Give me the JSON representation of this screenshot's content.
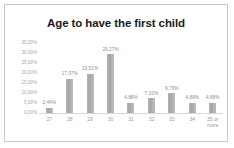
{
  "chart_data": {
    "type": "bar",
    "title": "Age to have the first child",
    "xlabel": "",
    "ylabel": "",
    "categories": [
      "27",
      "28",
      "29",
      "30",
      "31",
      "32",
      "33",
      "34",
      "35 or more"
    ],
    "values": [
      2.44,
      17.07,
      19.51,
      29.27,
      4.88,
      7.32,
      9.76,
      4.88,
      4.88
    ],
    "data_labels": [
      "2,44%",
      "17,07%",
      "19,51%",
      "29,27%",
      "4,88%",
      "7,32%",
      "9,76%",
      "4,88%",
      "4,88%"
    ],
    "ylim": [
      0,
      35
    ],
    "ytick_values": [
      35,
      30,
      25,
      20,
      15,
      10,
      5,
      0
    ],
    "ytick_labels": [
      "35,00%",
      "30,00%",
      "25,00%",
      "20,00%",
      "15,00%",
      "10,00%",
      "5,00%",
      "0,00%"
    ],
    "grid": false,
    "legend": false,
    "bar_color": "#adadad",
    "title_color": "#1a1a1a",
    "axis_label_color": "#9a9a9a",
    "data_label_color": "#8f8f8f",
    "border_color": "#c9c9c9",
    "background_color": "#ffffff"
  }
}
